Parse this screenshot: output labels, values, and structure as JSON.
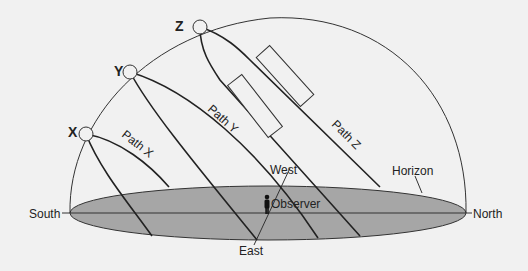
{
  "diagram": {
    "points": {
      "x": "X",
      "y": "Y",
      "z": "Z"
    },
    "paths": {
      "x": "Path X",
      "y": "Path Y",
      "z": "Path Z"
    },
    "directions": {
      "south": "South",
      "north": "North",
      "east": "East",
      "west": "West"
    },
    "labels": {
      "horizon": "Horizon",
      "observer": "Observer"
    },
    "colors": {
      "background": "#f1f1f1",
      "horizon_fill": "#a6a6a6",
      "line": "#222222"
    }
  }
}
